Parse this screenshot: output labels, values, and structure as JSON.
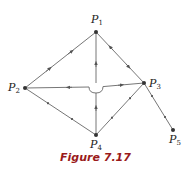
{
  "figure": {
    "caption": "Figure 7.17",
    "colors": {
      "edge": "#666666",
      "node": "#333333",
      "caption": "#9a1a1a"
    }
  },
  "nodes": [
    {
      "id": "P1",
      "letter": "P",
      "index": "1",
      "x": 96,
      "y": 32,
      "label_x": 91,
      "label_y": 14
    },
    {
      "id": "P2",
      "letter": "P",
      "index": "2",
      "x": 25,
      "y": 88,
      "label_x": 8,
      "label_y": 82
    },
    {
      "id": "P3",
      "letter": "P",
      "index": "3",
      "x": 144,
      "y": 83,
      "label_x": 149,
      "label_y": 78
    },
    {
      "id": "P4",
      "letter": "P",
      "index": "4",
      "x": 96,
      "y": 135,
      "label_x": 90,
      "label_y": 139
    },
    {
      "id": "P5",
      "letter": "P",
      "index": "5",
      "x": 173,
      "y": 130,
      "label_x": 169,
      "label_y": 134
    }
  ],
  "edges": [
    {
      "from": "P2",
      "to": "P1",
      "direction": "to-P1",
      "confidence": "clear"
    },
    {
      "from": "P1",
      "to": "P3",
      "direction": "opposed",
      "confidence": "tentative"
    },
    {
      "from": "P4",
      "to": "P1",
      "direction": "to-P1",
      "confidence": "tentative",
      "crossing_hop_at": [
        96,
        88
      ]
    },
    {
      "from": "P2",
      "to": "P3",
      "direction": "bidirectional",
      "confidence": "fairly-confident"
    },
    {
      "from": "P2",
      "to": "P4",
      "direction": "unresolved"
    },
    {
      "from": "P4",
      "to": "P3",
      "direction": "unresolved"
    },
    {
      "from": "P3",
      "to": "P5",
      "direction": "unresolved"
    }
  ]
}
